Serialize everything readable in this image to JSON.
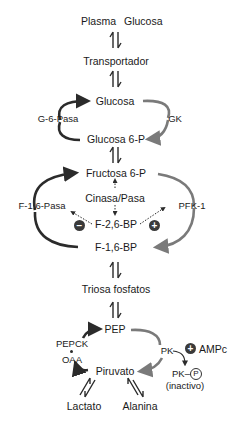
{
  "diagram": {
    "colors": {
      "dark_arrow": "#2b2b2b",
      "gray_arrow": "#7a7a7a",
      "text": "#1a1a1a",
      "badge": "#3a3a3a"
    },
    "nodes": {
      "plasma": "Plasma",
      "plasma_glucosa": "Glucosa",
      "transportador": "Transportador",
      "glucosa": "Glucosa",
      "glucosa6p": "Glucosa 6-P",
      "fructosa6p": "Fructosa 6-P",
      "f26bp": "F-2,6-BP",
      "f16bp": "F-1,6-BP",
      "triosa": "Triosa fosfatos",
      "pep": "PEP",
      "oaa": "OAA",
      "piruvato": "Piruvato",
      "lactato": "Lactato",
      "alanina": "Alanina",
      "pk_p": "PK–",
      "p_symbol": "P",
      "inactivo": "(inactivo)"
    },
    "enzymes": {
      "g6pasa": "G-6-Pasa",
      "gk": "GK",
      "cinasa_pasa": "Cinasa/Pasa",
      "f16pasa": "F-1,6-Pasa",
      "pfk1": "PFK-1",
      "pepck": "PEPCK",
      "pk": "PK"
    },
    "regulators": {
      "minus": "−",
      "plus": "+",
      "ampc_plus": "+",
      "ampc": "AMPc"
    }
  }
}
